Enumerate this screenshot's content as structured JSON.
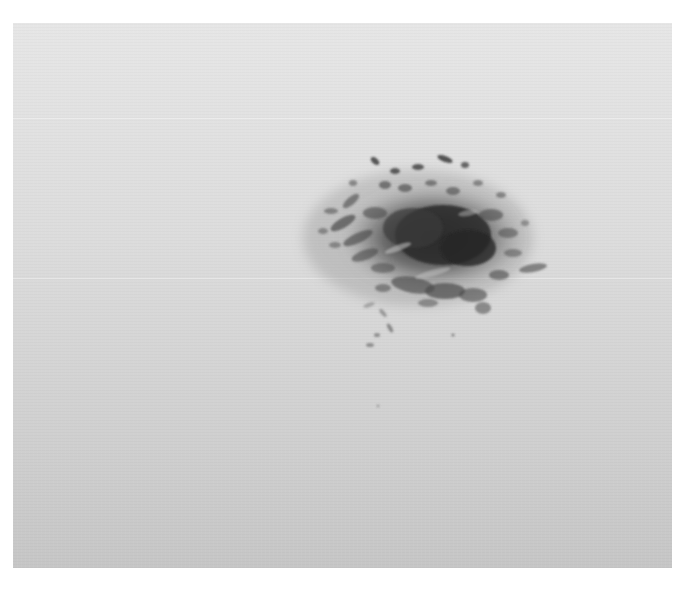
{
  "image": {
    "kind": "grayscale photograph",
    "subject": "dark irregular speckled blot on light gray background",
    "colors": {
      "page_background": "#ffffff",
      "photo_top": "#e6e6e6",
      "photo_bottom": "#c6c6c6",
      "blot_core": "#2e2e2e",
      "blot_mid": "#5a5a5a",
      "blot_edge": "#8a8a8a"
    }
  }
}
